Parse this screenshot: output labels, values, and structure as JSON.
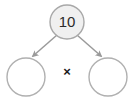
{
  "diagram": {
    "type": "factor-tree",
    "background_color": "#ffffff",
    "root": {
      "label": "10",
      "fill_color": "#f0f0f0",
      "stroke_color": "#a8a8a8",
      "cx": 67,
      "cy": 22,
      "r": 17
    },
    "operator": {
      "symbol": "×",
      "name": "multiplication-sign",
      "color": "#1a1a1a",
      "cx": 67,
      "cy": 73
    },
    "children": [
      {
        "label": "",
        "name": "left-factor",
        "fill_color": "#ffffff",
        "stroke_color": "#b0b0b0",
        "cx": 26,
        "cy": 77,
        "r": 19
      },
      {
        "label": "",
        "name": "right-factor",
        "fill_color": "#ffffff",
        "stroke_color": "#b0b0b0",
        "cx": 108,
        "cy": 77,
        "r": 19
      }
    ],
    "arrows": [
      {
        "name": "arrow-to-left-factor",
        "color": "#9a9a9a",
        "x1": 57,
        "y1": 35,
        "x2": 33,
        "y2": 56
      },
      {
        "name": "arrow-to-right-factor",
        "color": "#9a9a9a",
        "x1": 77,
        "y1": 35,
        "x2": 101,
        "y2": 56
      }
    ]
  }
}
